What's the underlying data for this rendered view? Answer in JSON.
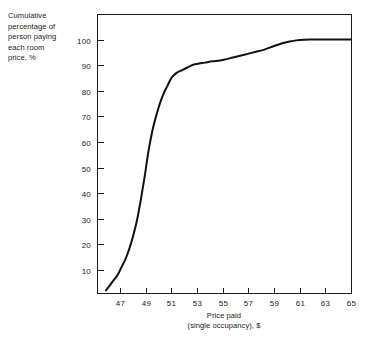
{
  "chart_data": {
    "type": "line",
    "title": "",
    "subtitle": "",
    "xlabel": "Price paid\n(single occupancy), $",
    "ylabel": "Cumulative\npercentage of\nperson paying\neach room\nprice, %",
    "xlabel_lines": [
      "Price paid",
      "(single occupancy), $"
    ],
    "ylabel_lines": [
      "Cumulative",
      "percentage of",
      "person paying",
      "each room",
      "price, %"
    ],
    "xlim": [
      45.2,
      65
    ],
    "ylim": [
      1,
      110
    ],
    "xticks": [
      47,
      49,
      51,
      53,
      55,
      57,
      59,
      61,
      63,
      65
    ],
    "xtick_labels": [
      "47",
      "49",
      "51",
      "53",
      "55",
      "57",
      "59",
      "61",
      "63",
      "65"
    ],
    "yticks": [
      10,
      20,
      30,
      40,
      50,
      60,
      70,
      80,
      90,
      100
    ],
    "ytick_labels": [
      "10",
      "20",
      "30",
      "40",
      "50",
      "60",
      "70",
      "80",
      "90",
      "100"
    ],
    "grid": false,
    "legend": false,
    "legend_position": "none",
    "frame": "full-box",
    "line_color": "#111111",
    "axis_color": "#1a1a1a",
    "background_color": "#ffffff",
    "series": [
      {
        "name": "Cumulative percentage of persons paying each room price",
        "x": [
          45.9,
          46.2,
          46.5,
          46.8,
          47.1,
          47.4,
          47.7,
          48.0,
          48.3,
          48.6,
          48.9,
          49.2,
          49.5,
          49.8,
          50.1,
          50.4,
          50.7,
          51.0,
          51.4,
          51.8,
          52.2,
          52.6,
          53.0,
          53.6,
          54.2,
          55.0,
          55.8,
          56.6,
          57.4,
          58.2,
          59.0,
          59.8,
          60.4,
          61.0,
          61.8,
          62.6,
          63.4,
          64.2,
          65.0
        ],
        "y": [
          2,
          4,
          6,
          8,
          11,
          14,
          18,
          23,
          29,
          37,
          46,
          56,
          64,
          70,
          75,
          79,
          82,
          85,
          87,
          88,
          89,
          90,
          90.5,
          91,
          91.5,
          92,
          93,
          94,
          95,
          96,
          97.5,
          98.8,
          99.4,
          99.8,
          100,
          100,
          100,
          100,
          100
        ]
      }
    ]
  },
  "axis_geometry": {
    "plot_left_px": 97,
    "plot_right_px": 351,
    "plot_top_px": 14,
    "plot_bottom_px": 293
  }
}
